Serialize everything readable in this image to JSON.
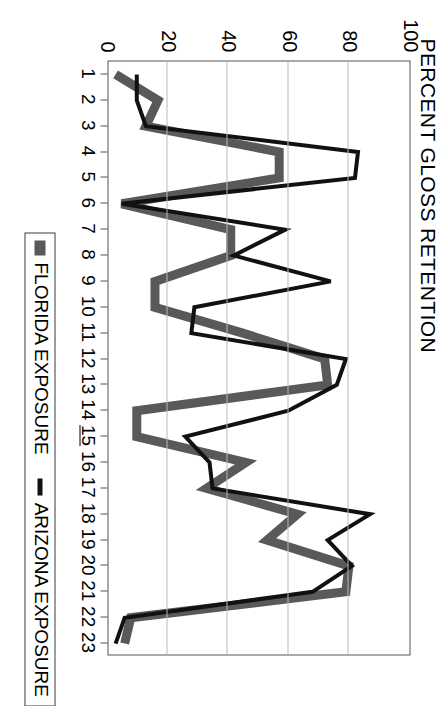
{
  "chart_data": {
    "type": "line",
    "title": "PERCENT GLOSS RETENTION",
    "xlabel": "",
    "ylabel": "",
    "orientation": "rotated-90",
    "grid": "value-axis-gridlines-only",
    "legend_position": "bottom",
    "ylim": [
      0,
      100
    ],
    "yticks": [
      0,
      20,
      40,
      60,
      80,
      100
    ],
    "categories": [
      "1",
      "2",
      "3",
      "4",
      "5",
      "6",
      "7",
      "8",
      "9",
      "10",
      "11",
      "12",
      "13",
      "14",
      "15",
      "16",
      "17",
      "18",
      "19",
      "20",
      "21",
      "22",
      "23"
    ],
    "highlighted_category": "15",
    "series": [
      {
        "name": "FLORIDA EXPOSURE",
        "color": "#595959",
        "style": "thick-gray",
        "values": [
          3,
          17,
          13,
          57,
          57,
          5,
          41,
          41,
          16,
          16,
          45,
          72,
          73,
          10,
          10,
          46,
          33,
          63,
          53,
          80,
          79,
          8,
          6
        ]
      },
      {
        "name": "ARIZONA EXPOSURE",
        "color": "#111111",
        "style": "thin-black",
        "values": [
          10,
          10,
          13,
          83,
          82,
          5,
          59,
          42,
          74,
          29,
          28,
          79,
          76,
          60,
          26,
          34,
          35,
          87,
          73,
          81,
          68,
          6,
          3
        ]
      }
    ]
  },
  "axes": {
    "y_tick_labels": [
      "100",
      "80",
      "60",
      "40",
      "20",
      "0"
    ],
    "x_tick_labels": [
      "1",
      "2",
      "3",
      "4",
      "5",
      "6",
      "7",
      "8",
      "9",
      "10",
      "11",
      "12",
      "13",
      "14",
      "15",
      "16",
      "17",
      "18",
      "19",
      "20",
      "21",
      "22",
      "23"
    ]
  },
  "legend": {
    "florida_label": "FLORIDA EXPOSURE",
    "arizona_label": "ARIZONA EXPOSURE"
  }
}
